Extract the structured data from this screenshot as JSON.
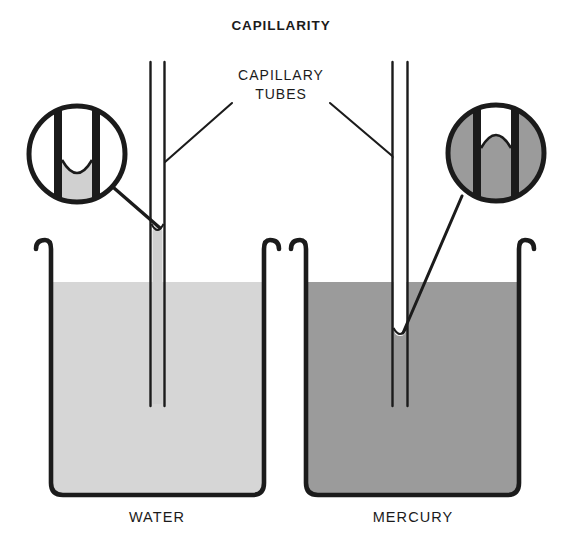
{
  "diagram": {
    "title": "CAPILLARITY",
    "callout": {
      "line1": "CAPILLARY",
      "line2": "TUBES"
    },
    "labels": {
      "left": "WATER",
      "right": "MERCURY"
    },
    "colors": {
      "ink": "#1b1b1b",
      "background": "#ffffff",
      "water_fill": "#d6d6d6",
      "mercury_fill": "#9b9b9b",
      "tube_water_fill": "#d0d0d0",
      "magnifier_empty": "#ffffff"
    },
    "panels": [
      {
        "name": "water-panel",
        "substance": "WATER",
        "fill": "#d6d6d6",
        "meniscus": "concave",
        "effect": "capillary rise",
        "column_above_reservoir": true
      },
      {
        "name": "mercury-panel",
        "substance": "MERCURY",
        "fill": "#9b9b9b",
        "meniscus": "convex",
        "effect": "capillary depression",
        "column_above_reservoir": false
      }
    ],
    "magnifiers": [
      {
        "name": "water-magnifier",
        "shows": "concave meniscus",
        "fill": "#d0d0d0"
      },
      {
        "name": "mercury-magnifier",
        "shows": "convex meniscus",
        "fill": "#9b9b9b"
      }
    ]
  }
}
